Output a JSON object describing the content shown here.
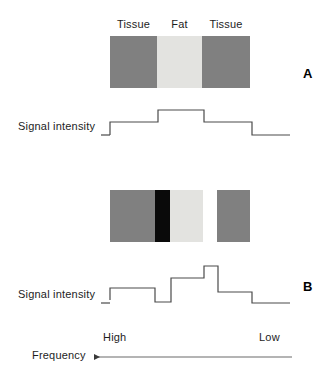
{
  "figure": {
    "panels": [
      {
        "letter": "A",
        "region_labels": [
          "Tissue",
          "Fat",
          "Tissue"
        ],
        "intensity_label": "Signal intensity",
        "specimen_bands": [
          {
            "name": "tissue-left",
            "color": "#808080",
            "width_px": 47
          },
          {
            "name": "fat",
            "color": "#e3e3e0",
            "width_px": 45
          },
          {
            "name": "tissue-right",
            "color": "#808080",
            "width_px": 48
          }
        ],
        "trace_points": "110,135 110,122 158,122 158,110 204,110 204,122 252,122 252,135 290,135"
      },
      {
        "letter": "B",
        "intensity_label": "Signal intensity",
        "specimen_bands": [
          {
            "name": "tissue-left",
            "color": "#808080",
            "width_px": 45
          },
          {
            "name": "black-band",
            "color": "#0a0a0a",
            "width_px": 15
          },
          {
            "name": "fat",
            "color": "#e3e3e0",
            "width_px": 33
          },
          {
            "name": "white-band",
            "color": "#ffffff",
            "width_px": 14
          },
          {
            "name": "tissue-right",
            "color": "#808080",
            "width_px": 33
          }
        ],
        "trace_points": "110,300 110,288 155,288 155,302 171,302 171,288 171,278 204,278 204,266 218,266 218,278 218,292 252,292 252,303 290,303"
      }
    ],
    "frequency_axis": {
      "label": "Frequency",
      "high_label": "High",
      "low_label": "Low",
      "direction": "left"
    },
    "colors": {
      "tissue": "#808080",
      "fat": "#e3e3e0",
      "black_band": "#0a0a0a",
      "white_band": "#ffffff",
      "trace_stroke": "#4a4a4a",
      "text": "#1d1d1d"
    }
  }
}
